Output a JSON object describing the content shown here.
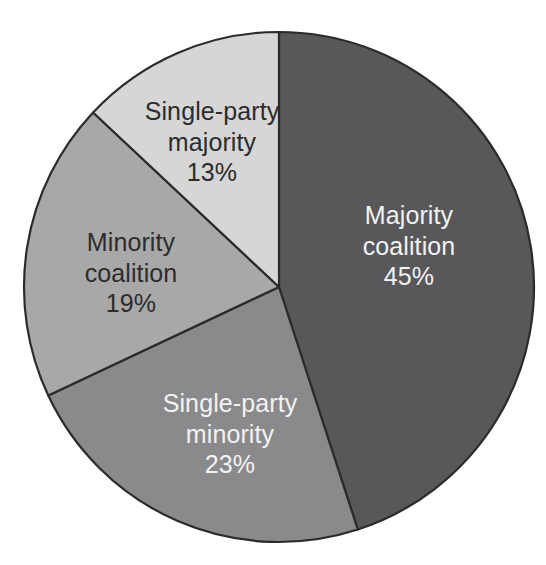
{
  "chart_data": {
    "type": "pie",
    "title": "",
    "subtitle": "",
    "xlabel": "",
    "ylabel": "",
    "legend": "none",
    "grid": false,
    "units": "percent",
    "start_angle_deg": 0,
    "direction": "clockwise",
    "categories": [
      "Majority coalition",
      "Single-party minority",
      "Minority coalition",
      "Single-party majority"
    ],
    "values": [
      45,
      23,
      19,
      13
    ],
    "slices": [
      {
        "label": "Majority coalition",
        "label_line1": "Majority",
        "label_line2": "coalition",
        "value": 45,
        "value_text": "45%",
        "color": "#58585a",
        "text_color": "#f2f2f2",
        "text_style": "light-text",
        "start_deg": 0,
        "end_deg": 162,
        "label_x": 409,
        "label_y": 246
      },
      {
        "label": "Single-party minority",
        "label_line1": "Single-party",
        "label_line2": "minority",
        "value": 23,
        "value_text": "23%",
        "color": "#8a8a8c",
        "text_color": "#f2f2f2",
        "text_style": "light-text",
        "start_deg": 162,
        "end_deg": 244.8,
        "label_x": 230,
        "label_y": 434
      },
      {
        "label": "Minority coalition",
        "label_line1": "Minority",
        "label_line2": "coalition",
        "value": 19,
        "value_text": "19%",
        "color": "#a8a8a8",
        "text_color": "#2c2c2c",
        "text_style": "dark-text",
        "start_deg": 244.8,
        "end_deg": 313.2,
        "label_x": 131,
        "label_y": 273
      },
      {
        "label": "Single-party majority",
        "label_line1": "Single-party",
        "label_line2": "majority",
        "value": 13,
        "value_text": "13%",
        "color": "#d6d6d6",
        "text_color": "#2c2c2c",
        "text_style": "dark-text",
        "start_deg": 313.2,
        "end_deg": 360,
        "label_x": 212,
        "label_y": 142
      }
    ],
    "geometry": {
      "center_x": 279,
      "center_y": 287,
      "radius": 255
    },
    "colors": {
      "background": "#ffffff",
      "outline": "#2b2b2b",
      "slice_1": "#58585a",
      "slice_2": "#8a8a8c",
      "slice_3": "#a8a8a8",
      "slice_4": "#d6d6d6"
    }
  }
}
